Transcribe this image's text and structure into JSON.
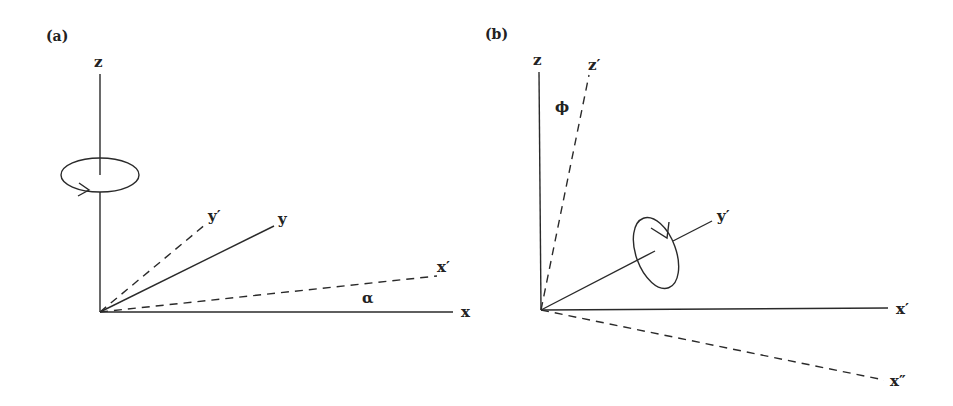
{
  "figure": {
    "panels": [
      {
        "id": "a",
        "label": "(a)",
        "axes": {
          "z": "z",
          "y": "y",
          "x": "x",
          "y_prime": "y′",
          "x_prime": "x′"
        },
        "angle_label": "α",
        "rotation_indicator": "rotation-about-z-axis"
      },
      {
        "id": "b",
        "label": "(b)",
        "axes": {
          "z": "z",
          "z_prime": "z′",
          "y_prime": "y′",
          "x_prime": "x′",
          "x_double_prime": "x″"
        },
        "angle_label": "ϕ",
        "rotation_indicator": "rotation-about-y-prime-axis"
      }
    ]
  }
}
